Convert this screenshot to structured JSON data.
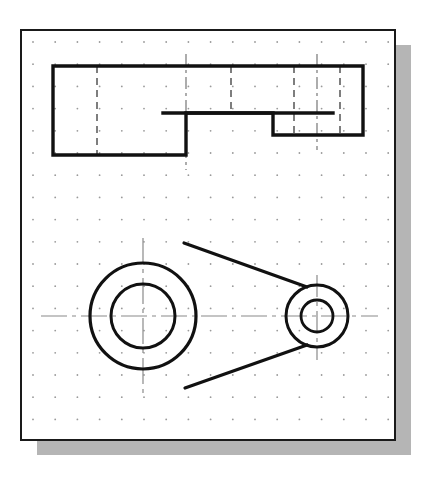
{
  "document": {
    "title": "Orthographic Engineering Drawing",
    "description": "Two-view technical drawing on dotted grid paper: stepped front view above, circular plan view below",
    "sheet_style": "dotted grid paper with drop shadow"
  },
  "colors": {
    "paper": "#ffffff",
    "border": "#1a1a1a",
    "object_line": "#111111",
    "hidden_line": "#3a3a3a",
    "center_line": "#8a8a8a",
    "grid_dot": "#9a9a9a",
    "shadow": "#a8a8a8",
    "page_background": "#ffffff"
  },
  "sheet": {
    "x": 21,
    "y": 30,
    "width": 374,
    "height": 410,
    "border_width": 2,
    "shadow_offset_x": 16,
    "shadow_offset_y": 15
  },
  "grid": {
    "label": "dot-grid",
    "spacing": 22.2,
    "origin_x": 33,
    "origin_y": 42,
    "dot_radius": 0.9,
    "columns": 17,
    "rows": 18
  },
  "front_view": {
    "name": "stepped-front-view",
    "outline_label": "stepped profile outline",
    "outline_points": "53,66 363,66 363,135 273,135 273,113 186,113 186,155 53,155",
    "hidden_line_label": "hidden edge line",
    "horizontal_hidden_line": {
      "x1": 163,
      "y1": 113,
      "x2": 333,
      "y2": 113
    },
    "vertical_hidden_lines": [
      {
        "x": 97,
        "y1": 66,
        "y2": 155,
        "style": "dashed"
      },
      {
        "x": 186,
        "y1": 54,
        "y2": 170,
        "style": "center"
      },
      {
        "x": 231,
        "y1": 66,
        "y2": 113,
        "style": "dashed"
      },
      {
        "x": 294,
        "y1": 66,
        "y2": 135,
        "style": "dashed"
      },
      {
        "x": 317,
        "y1": 54,
        "y2": 150,
        "style": "center"
      },
      {
        "x": 340,
        "y1": 66,
        "y2": 135,
        "style": "dashed"
      }
    ]
  },
  "plan_view": {
    "name": "circular-plan-view",
    "large_boss": {
      "label": "large-boss",
      "cx": 143,
      "cy": 316,
      "outer_radius": 53,
      "inner_radius": 32
    },
    "small_boss": {
      "label": "small-boss",
      "cx": 317,
      "cy": 316,
      "outer_radius": 31,
      "inner_radius": 16
    },
    "tangent_lines": [
      {
        "label": "upper-tangent",
        "x1": 184,
        "y1": 243,
        "x2": 307,
        "y2": 287
      },
      {
        "label": "lower-tangent",
        "x1": 185,
        "y1": 388,
        "x2": 307,
        "y2": 345
      }
    ],
    "center_lines": {
      "horizontal": {
        "x1": 41,
        "y1": 316,
        "x2": 378,
        "y2": 316
      },
      "vertical_large": {
        "x": 143,
        "y1": 238,
        "y2": 398
      },
      "vertical_small": {
        "x": 317,
        "y1": 275,
        "y2": 360
      }
    }
  }
}
